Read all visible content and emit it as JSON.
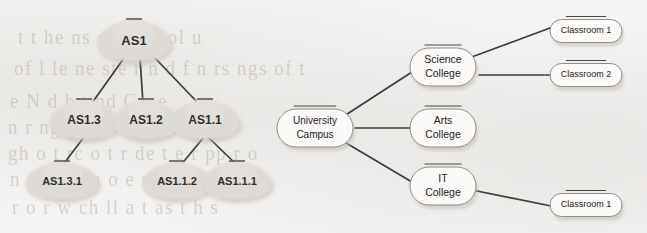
{
  "page": {
    "width": 647,
    "height": 233,
    "background_color": "#f4f3f1",
    "ghost_text_color": "#b9b4ae",
    "edge_color": "#3d3b39",
    "node_fill_cloud": "#dedbd7",
    "node_fill_rect": "#fbfaf9",
    "node_border_rect": "#8f8b86"
  },
  "background_ghost_text": [
    {
      "text": "t t he ns or r n r ol u",
      "x": 18,
      "y": 26
    },
    {
      "text": "of  l le        ne ste r n d f n     rs ngs  of  t",
      "x": 14,
      "y": 57
    },
    {
      "text": "e N d b t nd    C      r e",
      "x": 10,
      "y": 90
    },
    {
      "text": "n   r ng pp or t s ar nt      h",
      "x": 8,
      "y": 116
    },
    {
      "text": "gh o t rc o t r de t e r pp r o",
      "x": 8,
      "y": 142
    },
    {
      "text": "n n   c n   t     n  o  e  n  t",
      "x": 10,
      "y": 168
    },
    {
      "text": "r  o   r  w ch    ll a t  as  t h    s",
      "x": 12,
      "y": 196
    }
  ],
  "diagrams": {
    "left": {
      "name": "autonomous-system-hierarchy",
      "nodes": [
        {
          "id": "as1",
          "label": "AS1",
          "x": 134,
          "y": 41,
          "rx": 35,
          "ry": 20,
          "font_size": 13
        },
        {
          "id": "as1_3",
          "label": "AS1.3",
          "x": 84,
          "y": 120,
          "rx": 33,
          "ry": 19,
          "font_size": 12
        },
        {
          "id": "as1_2",
          "label": "AS1.2",
          "x": 146,
          "y": 120,
          "rx": 31,
          "ry": 19,
          "font_size": 12
        },
        {
          "id": "as1_1",
          "label": "AS1.1",
          "x": 205,
          "y": 120,
          "rx": 33,
          "ry": 19,
          "font_size": 12
        },
        {
          "id": "as1_3_1",
          "label": "AS1.3.1",
          "x": 62,
          "y": 181,
          "rx": 35,
          "ry": 18,
          "font_size": 11
        },
        {
          "id": "as1_1_2",
          "label": "AS1.1.2",
          "x": 177,
          "y": 181,
          "rx": 33,
          "ry": 18,
          "font_size": 11
        },
        {
          "id": "as1_1_1",
          "label": "AS1.1.1",
          "x": 237,
          "y": 181,
          "rx": 33,
          "ry": 18,
          "font_size": 11
        }
      ],
      "edges": [
        {
          "from": "as1",
          "to": "as1_3",
          "x1": 124,
          "y1": 58,
          "x2": 92,
          "y2": 103
        },
        {
          "from": "as1",
          "to": "as1_2",
          "x1": 140,
          "y1": 58,
          "x2": 143,
          "y2": 103
        },
        {
          "from": "as1",
          "to": "as1_1",
          "x1": 155,
          "y1": 58,
          "x2": 198,
          "y2": 103
        },
        {
          "from": "as1_3",
          "to": "as1_3_1",
          "x1": 84,
          "y1": 137,
          "x2": 62,
          "y2": 166
        },
        {
          "from": "as1_1",
          "to": "as1_1_2",
          "x1": 204,
          "y1": 137,
          "x2": 180,
          "y2": 166
        },
        {
          "from": "as1_1",
          "to": "as1_1_1",
          "x1": 208,
          "y1": 137,
          "x2": 238,
          "y2": 166
        }
      ]
    },
    "right": {
      "name": "university-campus-hierarchy",
      "nodes": [
        {
          "id": "campus",
          "lines": [
            "University",
            "Campus"
          ],
          "x": 315,
          "y": 128,
          "w": 76,
          "h": 38,
          "font_size": 10
        },
        {
          "id": "science",
          "lines": [
            "Science",
            "College"
          ],
          "x": 443,
          "y": 67,
          "w": 66,
          "h": 38,
          "font_size": 10.5
        },
        {
          "id": "arts",
          "lines": [
            "Arts",
            "College"
          ],
          "x": 443,
          "y": 128,
          "w": 66,
          "h": 38,
          "font_size": 10.5
        },
        {
          "id": "it",
          "lines": [
            "IT",
            "College"
          ],
          "x": 443,
          "y": 186,
          "w": 66,
          "h": 38,
          "font_size": 10.5
        },
        {
          "id": "classroom1",
          "lines": [
            "Classroom 1"
          ],
          "x": 586,
          "y": 31,
          "w": 72,
          "h": 23,
          "font_size": 9
        },
        {
          "id": "classroom2",
          "lines": [
            "Classroom 2"
          ],
          "x": 586,
          "y": 75,
          "w": 72,
          "h": 23,
          "font_size": 9
        },
        {
          "id": "classroom3",
          "lines": [
            "Classroom 1"
          ],
          "x": 586,
          "y": 205,
          "w": 72,
          "h": 23,
          "font_size": 9
        }
      ],
      "edges": [
        {
          "from": "campus",
          "to": "science",
          "x1": 341,
          "y1": 118,
          "x2": 412,
          "y2": 72
        },
        {
          "from": "campus",
          "to": "arts",
          "x1": 355,
          "y1": 128,
          "x2": 410,
          "y2": 128
        },
        {
          "from": "campus",
          "to": "it",
          "x1": 341,
          "y1": 140,
          "x2": 412,
          "y2": 182
        },
        {
          "from": "science",
          "to": "classroom1",
          "x1": 469,
          "y1": 58,
          "x2": 550,
          "y2": 28
        },
        {
          "from": "science",
          "to": "classroom2",
          "x1": 479,
          "y1": 75,
          "x2": 550,
          "y2": 75
        },
        {
          "from": "it",
          "to": "classroom3",
          "x1": 472,
          "y1": 190,
          "x2": 551,
          "y2": 206
        }
      ]
    }
  }
}
